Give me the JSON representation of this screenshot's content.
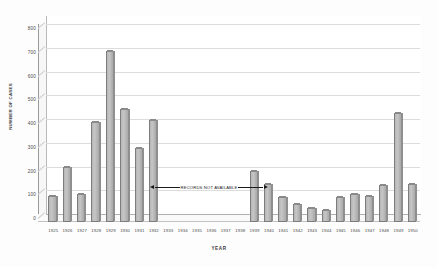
{
  "chart_data": {
    "type": "bar",
    "title": "",
    "xlabel": "YEAR",
    "ylabel": "NUMBER OF CASES",
    "ylim": [
      0,
      800
    ],
    "ytick_step": 100,
    "yticks": [
      "0",
      "100",
      "200",
      "300",
      "400",
      "500",
      "600",
      "700",
      "800"
    ],
    "grid": true,
    "legend": "none",
    "categories": [
      "1925",
      "1926",
      "1927",
      "1928",
      "1929",
      "1930",
      "1931",
      "1932",
      "1933",
      "1934",
      "1935",
      "1936",
      "1937",
      "1938",
      "1939",
      "1940",
      "1941",
      "1942",
      "1943",
      "1944",
      "1945",
      "1946",
      "1947",
      "1948",
      "1949",
      "1950"
    ],
    "values": [
      110,
      230,
      120,
      420,
      720,
      475,
      310,
      430,
      null,
      null,
      null,
      null,
      null,
      null,
      215,
      160,
      105,
      75,
      60,
      50,
      105,
      120,
      110,
      155,
      460,
      160
    ],
    "missing_categories": [
      "1933",
      "1934",
      "1935",
      "1936",
      "1937",
      "1938"
    ],
    "annotations": [
      {
        "text": "RECORDS NOT AVAILABLE",
        "arrow_left": "◀",
        "arrow_right": "▶",
        "spans_categories": [
          "1933",
          "1938"
        ]
      }
    ],
    "colors": {
      "bar_fill": "#c0c0c0",
      "bar_edge": "#7d7d7d",
      "gridline": "#dcdcdc",
      "background": "#ffffff",
      "text": "#4a4a4a"
    }
  }
}
